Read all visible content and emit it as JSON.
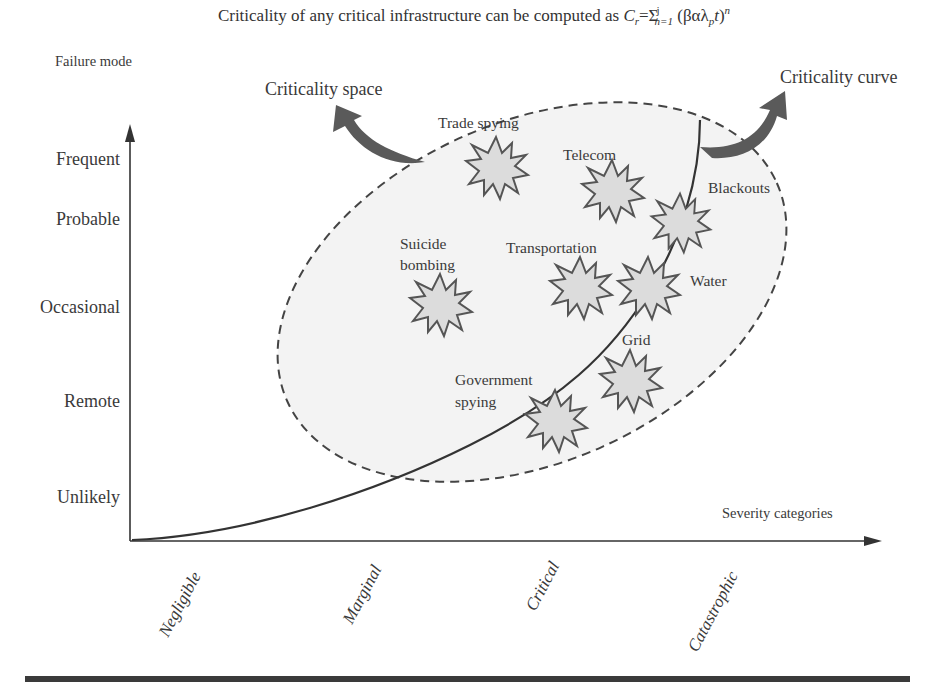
{
  "title": {
    "prefix": "Criticality of any critical infrastructure can be computed as ",
    "formula_lhs": "C",
    "formula_lhs_sub": "r",
    "formula_eq": "=Σ",
    "sum_sup": "j",
    "sum_sub": "n=1",
    "formula_body_open": " (βαλ",
    "lambda_sub": "p",
    "formula_t": "t",
    "formula_close": ")",
    "power": "n"
  },
  "axes": {
    "y_title": "Failure mode",
    "x_title": "Severity categories",
    "y_levels": [
      "Frequent",
      "Probable",
      "Occasional",
      "Remote",
      "Unlikely"
    ],
    "x_levels": [
      "Negligible",
      "Marginal",
      "Critical",
      "Catastrophic"
    ]
  },
  "annotations": {
    "criticality_space": "Criticality space",
    "criticality_curve": "Criticality curve"
  },
  "threats": [
    {
      "label": "Trade spying",
      "label2": ""
    },
    {
      "label": "Telecom",
      "label2": ""
    },
    {
      "label": "Blackouts",
      "label2": ""
    },
    {
      "label": "Suicide",
      "label2": "bombing"
    },
    {
      "label": "Transportation",
      "label2": ""
    },
    {
      "label": "Water",
      "label2": ""
    },
    {
      "label": "Grid",
      "label2": ""
    },
    {
      "label": "Government",
      "label2": "spying"
    }
  ],
  "colors": {
    "ellipse_fill": "#f3f3f3",
    "ellipse_stroke": "#444444",
    "star_fill": "#dcdcdc",
    "star_stroke": "#555555",
    "arrow_fill": "#5a5a5a",
    "axis": "#333333",
    "rule": "#3a3a3a"
  }
}
